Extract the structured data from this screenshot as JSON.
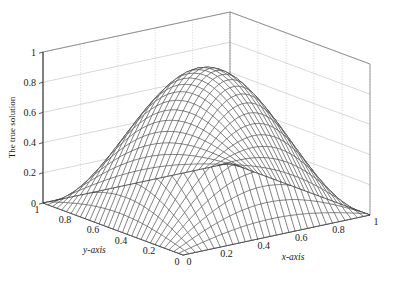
{
  "chart_data": {
    "type": "surface",
    "title": "",
    "xlabel": "x-axis",
    "ylabel": "y-axis",
    "zlabel": "The true solution",
    "xlim": [
      0,
      1
    ],
    "ylim": [
      0,
      1
    ],
    "zlim": [
      0,
      1
    ],
    "xticks": [
      0,
      0.2,
      0.4,
      0.6,
      0.8,
      1
    ],
    "xtick_labels": [
      "0",
      "0.2",
      "0.4",
      "0.6",
      "0.8",
      "1"
    ],
    "yticks": [
      0,
      0.2,
      0.4,
      0.6,
      0.8,
      1
    ],
    "ytick_labels": [
      "0",
      "0.2",
      "0.4",
      "0.6",
      "0.8",
      "1"
    ],
    "zticks": [
      0,
      0.2,
      0.4,
      0.6,
      0.8,
      1
    ],
    "ztick_labels": [
      "0",
      "0.2",
      "0.4",
      "0.6",
      "0.8",
      "1"
    ],
    "grid": true,
    "legend": "none",
    "mesh_divisions": 30,
    "surface_function": "0.93*sin(pi*x)*sin(pi*y)",
    "peak_value": 0.93,
    "peak_location": [
      0.5,
      0.5
    ],
    "boundary_values": 0,
    "mesh_color": "#333333",
    "grid_color": "#b8b8b8",
    "axis_color": "#555555",
    "background": "#ffffff",
    "view_azimuth": -37.5,
    "view_elevation": 30,
    "sampled_surface": {
      "x": [
        0,
        0.1,
        0.2,
        0.3,
        0.4,
        0.5,
        0.6,
        0.7,
        0.8,
        0.9,
        1
      ],
      "y": [
        0,
        0.1,
        0.2,
        0.3,
        0.4,
        0.5,
        0.6,
        0.7,
        0.8,
        0.9,
        1
      ],
      "z": [
        [
          0,
          0,
          0,
          0,
          0,
          0,
          0,
          0,
          0,
          0,
          0
        ],
        [
          0,
          0.089,
          0.169,
          0.232,
          0.273,
          0.287,
          0.273,
          0.232,
          0.169,
          0.089,
          0
        ],
        [
          0,
          0.169,
          0.321,
          0.442,
          0.52,
          0.547,
          0.52,
          0.442,
          0.321,
          0.169,
          0
        ],
        [
          0,
          0.232,
          0.442,
          0.608,
          0.715,
          0.752,
          0.715,
          0.608,
          0.442,
          0.232,
          0
        ],
        [
          0,
          0.273,
          0.52,
          0.715,
          0.841,
          0.885,
          0.841,
          0.715,
          0.52,
          0.273,
          0
        ],
        [
          0,
          0.287,
          0.547,
          0.752,
          0.885,
          0.93,
          0.885,
          0.752,
          0.547,
          0.287,
          0
        ],
        [
          0,
          0.273,
          0.52,
          0.715,
          0.841,
          0.885,
          0.841,
          0.715,
          0.52,
          0.273,
          0
        ],
        [
          0,
          0.232,
          0.442,
          0.608,
          0.715,
          0.752,
          0.715,
          0.608,
          0.442,
          0.232,
          0
        ],
        [
          0,
          0.169,
          0.321,
          0.442,
          0.52,
          0.547,
          0.52,
          0.442,
          0.321,
          0.169,
          0
        ],
        [
          0,
          0.089,
          0.169,
          0.232,
          0.273,
          0.287,
          0.273,
          0.232,
          0.169,
          0.089,
          0
        ],
        [
          0,
          0,
          0,
          0,
          0,
          0,
          0,
          0,
          0,
          0,
          0
        ]
      ]
    }
  },
  "axes": {
    "z": {
      "label": "The true solution",
      "ticks": [
        "1",
        "0.8",
        "0.6",
        "0.4",
        "0.2",
        "0"
      ]
    },
    "y": {
      "label": "y-axis",
      "ticks": [
        "1",
        "0.8",
        "0.6",
        "0.4",
        "0.2",
        "0"
      ]
    },
    "x": {
      "label": "x-axis",
      "ticks": [
        "0",
        "0.2",
        "0.4",
        "0.6",
        "0.8",
        "1"
      ]
    }
  }
}
